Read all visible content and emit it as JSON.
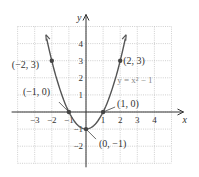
{
  "chart_data": {
    "type": "line",
    "title": "",
    "xlabel": "x",
    "ylabel": "y",
    "equation_label": "y = x² − 1",
    "function": "x^2 - 1",
    "xlim": [
      -4,
      5
    ],
    "ylim": [
      -3,
      5
    ],
    "grid": true,
    "x_ticks": [
      "−3",
      "−2",
      "−1",
      "1",
      "2",
      "3",
      "4"
    ],
    "x_tick_values": [
      -3,
      -2,
      -1,
      1,
      2,
      3,
      4
    ],
    "y_ticks": [
      "4",
      "3",
      "2",
      "1",
      "−1",
      "−2"
    ],
    "y_tick_values": [
      4,
      3,
      2,
      1,
      -1,
      -2
    ],
    "series": [
      {
        "name": "y = x^2 - 1",
        "x": [
          -2.3,
          -2,
          -1,
          0,
          1,
          2,
          2.3
        ],
        "y": [
          4.29,
          3,
          0,
          -1,
          0,
          3,
          4.29
        ]
      }
    ],
    "points": [
      {
        "x": -2,
        "y": 3,
        "label": "(−2, 3)"
      },
      {
        "x": 2,
        "y": 3,
        "label": "(2, 3)"
      },
      {
        "x": -1,
        "y": 0,
        "label": "(−1, 0)"
      },
      {
        "x": 1,
        "y": 0,
        "label": "(1, 0)"
      },
      {
        "x": 0,
        "y": -1,
        "label": "(0, −1)"
      }
    ],
    "colors": {
      "curve": "#555555",
      "grid": "#bbbbbb",
      "axis": "#333333",
      "point": "#444444"
    }
  }
}
